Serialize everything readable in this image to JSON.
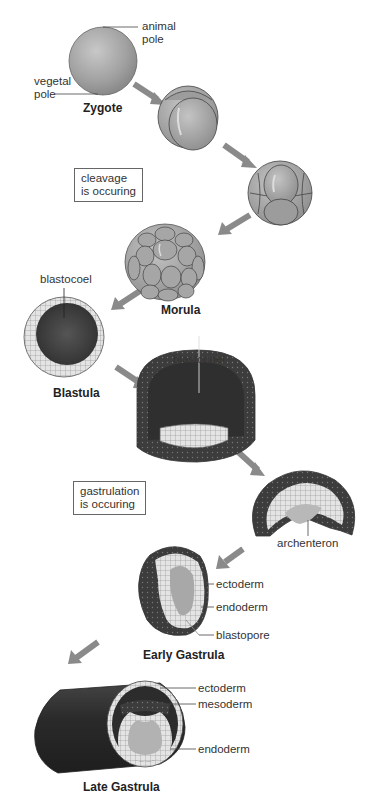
{
  "diagram": {
    "stages": [
      {
        "id": "zygote",
        "title": "Zygote"
      },
      {
        "id": "two-cell",
        "title": ""
      },
      {
        "id": "eight-cell",
        "title": ""
      },
      {
        "id": "morula",
        "title": "Morula"
      },
      {
        "id": "blastula",
        "title": "Blastula"
      },
      {
        "id": "blastula-section",
        "title": ""
      },
      {
        "id": "invagination",
        "title": ""
      },
      {
        "id": "early-gastrula",
        "title": "Early Gastrula"
      },
      {
        "id": "late-gastrula",
        "title": "Late Gastrula"
      }
    ],
    "labels": {
      "animal_pole": [
        "animal",
        "pole"
      ],
      "vegetal_pole": [
        "vegetal",
        "pole"
      ],
      "blastocoel_1": "blastocoel",
      "blastocoel_2": "blastocoel",
      "archenteron": "archenteron",
      "ectoderm_1": "ectoderm",
      "endoderm_1": "endoderm",
      "blastopore": "blastopore",
      "ectoderm_2": "ectoderm",
      "mesoderm": "mesoderm",
      "endoderm_2": "endoderm"
    },
    "callouts": {
      "cleavage": [
        "cleavage",
        "is occuring"
      ],
      "gastrulation": [
        "gastrulation",
        "is occuring"
      ]
    },
    "colors": {
      "cell_gray": "#9a9a9a",
      "dark_tissue": "#3a3a3a",
      "light_cells": "#e8e8e8",
      "arrow": "#8a8a8a"
    }
  }
}
